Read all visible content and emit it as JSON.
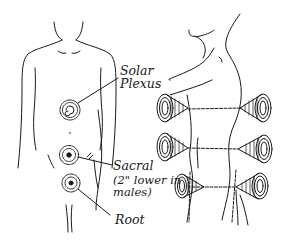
{
  "figure": {
    "front_view": {
      "chakras": [
        {
          "id": "solar-plexus",
          "label_line1": "Solar",
          "label_line2": "Plexus"
        },
        {
          "id": "sacral",
          "label_line1": "Sacral",
          "label_note_line1": "(2\" lower in",
          "label_note_line2": "males)"
        },
        {
          "id": "root",
          "label_line1": "Root"
        }
      ]
    },
    "side_view": {
      "vortex_pairs": 3
    },
    "colors": {
      "ink": "#1a1a1a",
      "background": "#ffffff"
    }
  }
}
